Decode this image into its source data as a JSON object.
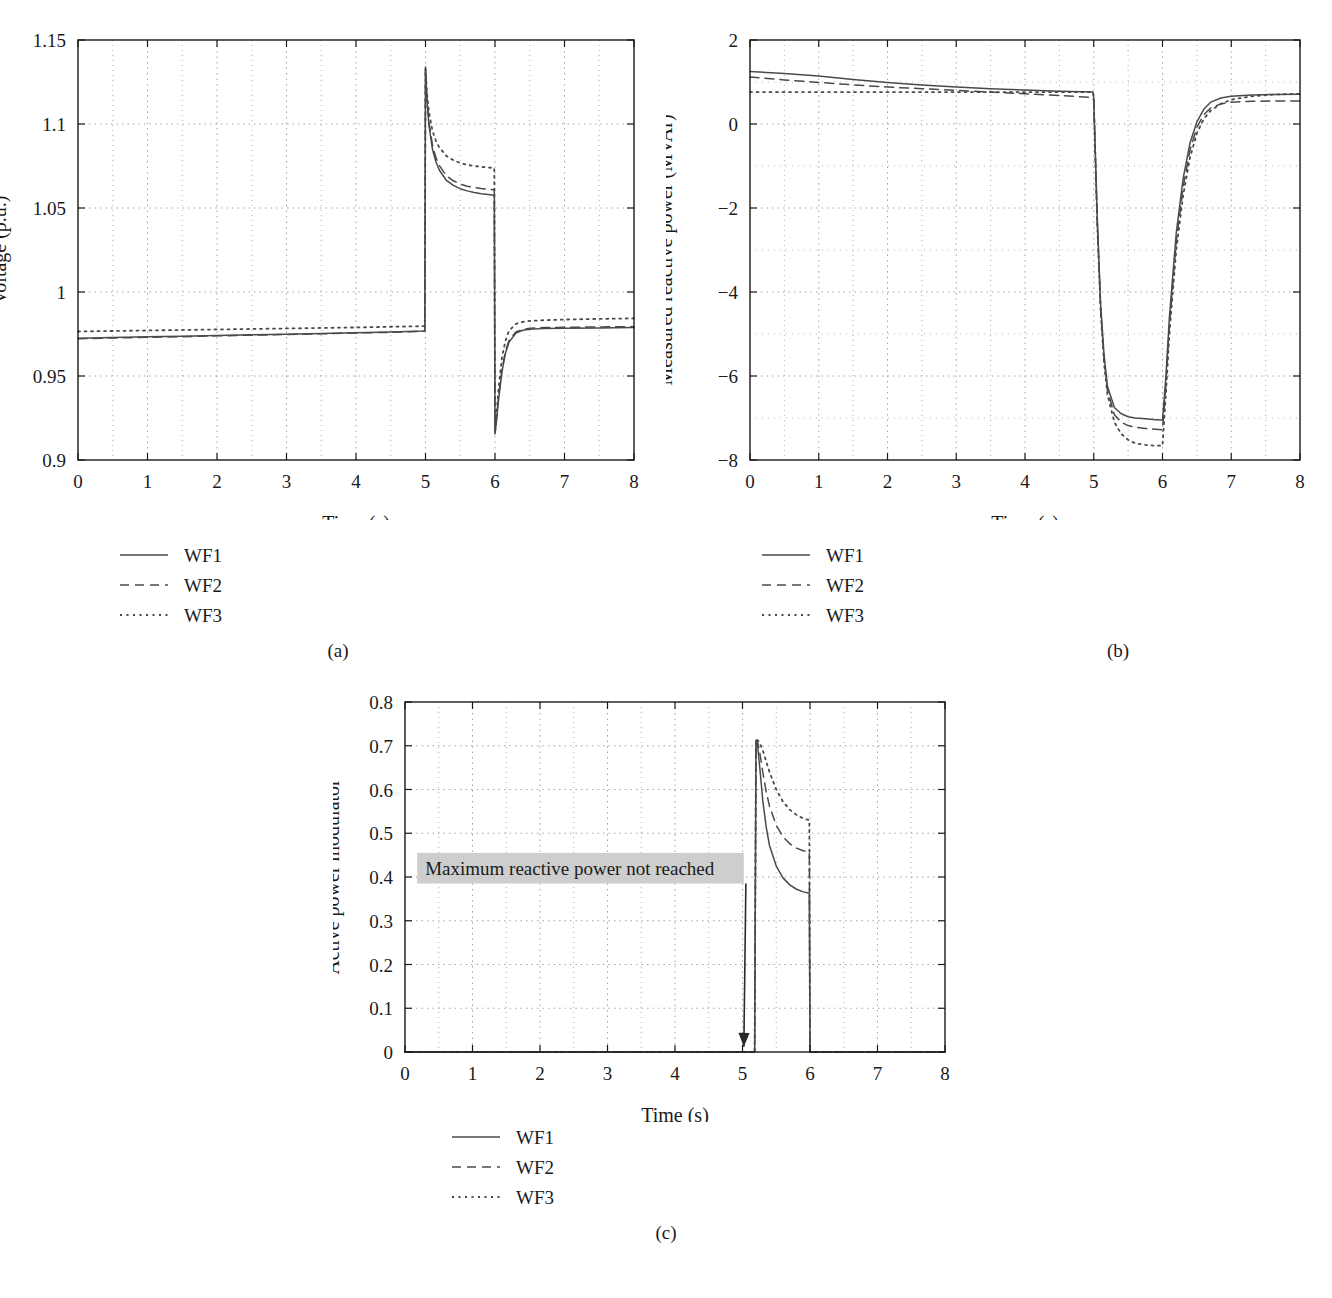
{
  "figure": {
    "panels": [
      {
        "id": "a",
        "caption": "(a)",
        "xlabel": "Time (s)",
        "ylabel": "Voltage (p.u.)"
      },
      {
        "id": "b",
        "caption": "(b)",
        "xlabel": "Time (s)",
        "ylabel": "Measured reactive power (MVAr)"
      },
      {
        "id": "c",
        "caption": "(c)",
        "xlabel": "Time (s)",
        "ylabel": "Active power modulator"
      }
    ],
    "legend": {
      "entries": [
        {
          "label": "WF1",
          "style": "solid"
        },
        {
          "label": "WF2",
          "style": "dashed"
        },
        {
          "label": "WF3",
          "style": "dotted"
        }
      ]
    },
    "annotation": {
      "text": "Maximum reactive power not reached",
      "highlight_color": "#c9c9c9",
      "arrow_from": [
        5.05,
        0.385
      ],
      "arrow_to": [
        5.02,
        0.012
      ]
    },
    "colors": {
      "line": "#4a4a4a",
      "axis": "#1a1a1a",
      "grid": "#9a9a9a",
      "background": "#ffffff"
    }
  },
  "chart_data": [
    {
      "type": "line",
      "panel": "a",
      "title": "",
      "xlabel": "Time (s)",
      "ylabel": "Voltage (p.u.)",
      "xlim": [
        0,
        8
      ],
      "ylim": [
        0.9,
        1.15
      ],
      "xticks": [
        0,
        1,
        2,
        3,
        4,
        5,
        6,
        7,
        8
      ],
      "yticks": [
        0.9,
        0.95,
        1,
        1.05,
        1.1,
        1.15
      ],
      "ytick_labels": [
        "0.9",
        "0.95",
        "1",
        "1.05",
        "1.1",
        "1.15"
      ],
      "grid": true,
      "legend_position": "below-left",
      "series": [
        {
          "name": "WF1",
          "style": "solid",
          "x": [
            0,
            0.5,
            1,
            1.5,
            2,
            2.5,
            3,
            3.5,
            4,
            4.5,
            4.99,
            5.0,
            5.02,
            5.05,
            5.1,
            5.15,
            5.2,
            5.3,
            5.4,
            5.5,
            5.6,
            5.7,
            5.8,
            5.9,
            5.99,
            6.0,
            6.02,
            6.05,
            6.1,
            6.15,
            6.2,
            6.3,
            6.4,
            6.5,
            6.7,
            7.0,
            7.5,
            8.0
          ],
          "y": [
            0.9725,
            0.9729,
            0.9733,
            0.9737,
            0.9741,
            0.9745,
            0.9749,
            0.9753,
            0.9757,
            0.9762,
            0.9768,
            1.134,
            1.115,
            1.099,
            1.085,
            1.0775,
            1.0725,
            1.0665,
            1.0635,
            1.0615,
            1.0602,
            1.0592,
            1.0585,
            1.058,
            1.0576,
            0.9155,
            0.9225,
            0.9355,
            0.9525,
            0.9635,
            0.97,
            0.9755,
            0.9772,
            0.9778,
            0.9782,
            0.9784,
            0.9786,
            0.9788
          ]
        },
        {
          "name": "WF2",
          "style": "dashed",
          "x": [
            0,
            0.5,
            1,
            1.5,
            2,
            2.5,
            3,
            3.5,
            4,
            4.5,
            4.99,
            5.0,
            5.02,
            5.05,
            5.1,
            5.15,
            5.2,
            5.3,
            5.4,
            5.5,
            5.6,
            5.7,
            5.8,
            5.9,
            5.99,
            6.0,
            6.02,
            6.05,
            6.1,
            6.15,
            6.2,
            6.3,
            6.4,
            6.5,
            6.7,
            7.0,
            7.5,
            8.0
          ],
          "y": [
            0.9722,
            0.9726,
            0.973,
            0.9734,
            0.9739,
            0.9743,
            0.9747,
            0.9751,
            0.9756,
            0.976,
            0.9766,
            1.132,
            1.116,
            1.101,
            1.0875,
            1.08,
            1.0752,
            1.0692,
            1.0662,
            1.0642,
            1.063,
            1.0622,
            1.0616,
            1.0612,
            1.0608,
            0.9165,
            0.924,
            0.9372,
            0.954,
            0.9648,
            0.971,
            0.9762,
            0.9778,
            0.9784,
            0.9788,
            0.979,
            0.9792,
            0.9794
          ]
        },
        {
          "name": "WF3",
          "style": "dotted",
          "x": [
            0,
            0.5,
            1,
            1.5,
            2,
            2.5,
            3,
            3.5,
            4,
            4.5,
            4.99,
            5.0,
            5.02,
            5.05,
            5.1,
            5.15,
            5.2,
            5.3,
            5.4,
            5.5,
            5.6,
            5.7,
            5.8,
            5.9,
            5.99,
            6.0,
            6.02,
            6.05,
            6.1,
            6.15,
            6.2,
            6.3,
            6.4,
            6.5,
            6.7,
            7.0,
            7.5,
            8.0
          ],
          "y": [
            0.9765,
            0.9768,
            0.9771,
            0.9774,
            0.9777,
            0.978,
            0.9783,
            0.9786,
            0.9789,
            0.9793,
            0.9797,
            1.133,
            1.119,
            1.107,
            1.096,
            1.09,
            1.086,
            1.081,
            1.0785,
            1.0768,
            1.0757,
            1.075,
            1.0745,
            1.0741,
            1.0738,
            0.916,
            0.926,
            0.942,
            0.961,
            0.971,
            0.9768,
            0.981,
            0.9822,
            0.9828,
            0.9832,
            0.9836,
            0.984,
            0.9843
          ]
        }
      ]
    },
    {
      "type": "line",
      "panel": "b",
      "title": "",
      "xlabel": "Time (s)",
      "ylabel": "Measured reactive power (MVAr)",
      "xlim": [
        0,
        8
      ],
      "ylim": [
        -8,
        2
      ],
      "xticks": [
        0,
        1,
        2,
        3,
        4,
        5,
        6,
        7,
        8
      ],
      "yticks": [
        -8,
        -6,
        -4,
        -2,
        0,
        2
      ],
      "ytick_labels": [
        "−8",
        "−6",
        "−4",
        "−2",
        "0",
        "2"
      ],
      "grid": true,
      "legend_position": "below-left",
      "series": [
        {
          "name": "WF1",
          "style": "solid",
          "x": [
            0,
            0.5,
            1,
            1.5,
            2,
            2.5,
            3,
            3.5,
            4,
            4.5,
            4.99,
            5.0,
            5.05,
            5.1,
            5.15,
            5.2,
            5.3,
            5.4,
            5.5,
            5.6,
            5.75,
            5.9,
            5.99,
            6.0,
            6.05,
            6.1,
            6.2,
            6.3,
            6.4,
            6.5,
            6.6,
            6.7,
            6.85,
            7.0,
            7.3,
            7.6,
            8.0
          ],
          "y": [
            1.25,
            1.2,
            1.14,
            1.06,
            0.99,
            0.93,
            0.88,
            0.84,
            0.81,
            0.78,
            0.76,
            0.62,
            -2.2,
            -4.3,
            -5.5,
            -6.25,
            -6.75,
            -6.9,
            -6.97,
            -7.0,
            -7.02,
            -7.04,
            -7.05,
            -7.05,
            -6.0,
            -4.6,
            -2.6,
            -1.3,
            -0.45,
            0.05,
            0.35,
            0.52,
            0.62,
            0.66,
            0.69,
            0.7,
            0.71
          ]
        },
        {
          "name": "WF2",
          "style": "dashed",
          "x": [
            0,
            0.5,
            1,
            1.5,
            2,
            2.5,
            3,
            3.5,
            4,
            4.5,
            4.99,
            5.0,
            5.05,
            5.1,
            5.15,
            5.2,
            5.3,
            5.4,
            5.5,
            5.6,
            5.75,
            5.9,
            5.99,
            6.0,
            6.05,
            6.1,
            6.2,
            6.3,
            6.4,
            6.5,
            6.6,
            6.7,
            6.85,
            7.0,
            7.3,
            7.6,
            8.0
          ],
          "y": [
            1.12,
            1.05,
            0.99,
            0.93,
            0.88,
            0.84,
            0.8,
            0.76,
            0.72,
            0.68,
            0.63,
            0.55,
            -2.3,
            -4.4,
            -5.6,
            -6.35,
            -6.92,
            -7.1,
            -7.18,
            -7.22,
            -7.25,
            -7.27,
            -7.28,
            -7.28,
            -6.2,
            -4.8,
            -2.8,
            -1.5,
            -0.62,
            -0.08,
            0.22,
            0.38,
            0.48,
            0.52,
            0.54,
            0.55,
            0.55
          ]
        },
        {
          "name": "WF3",
          "style": "dotted",
          "x": [
            0,
            0.5,
            1,
            1.5,
            2,
            2.5,
            3,
            3.5,
            4,
            4.5,
            4.99,
            5.0,
            5.05,
            5.1,
            5.15,
            5.2,
            5.3,
            5.4,
            5.5,
            5.6,
            5.75,
            5.9,
            5.99,
            6.0,
            6.05,
            6.1,
            6.2,
            6.3,
            6.4,
            6.5,
            6.6,
            6.7,
            6.85,
            7.0,
            7.3,
            7.6,
            8.0
          ],
          "y": [
            0.76,
            0.76,
            0.76,
            0.76,
            0.76,
            0.76,
            0.76,
            0.76,
            0.76,
            0.76,
            0.76,
            0.6,
            -2.35,
            -4.45,
            -5.7,
            -6.45,
            -7.1,
            -7.38,
            -7.52,
            -7.6,
            -7.64,
            -7.66,
            -7.66,
            -7.66,
            -6.4,
            -5.0,
            -3.0,
            -1.7,
            -0.8,
            -0.22,
            0.12,
            0.32,
            0.48,
            0.58,
            0.66,
            0.7,
            0.72
          ]
        }
      ]
    },
    {
      "type": "line",
      "panel": "c",
      "title": "",
      "xlabel": "Time (s)",
      "ylabel": "Active power modulator",
      "xlim": [
        0,
        8
      ],
      "ylim": [
        0,
        0.8
      ],
      "xticks": [
        0,
        1,
        2,
        3,
        4,
        5,
        6,
        7,
        8
      ],
      "yticks": [
        0,
        0.1,
        0.2,
        0.3,
        0.4,
        0.5,
        0.6,
        0.7,
        0.8
      ],
      "ytick_labels": [
        "0",
        "0.1",
        "0.2",
        "0.3",
        "0.4",
        "0.5",
        "0.6",
        "0.7",
        "0.8"
      ],
      "grid": true,
      "legend_position": "below-left",
      "series": [
        {
          "name": "WF1",
          "style": "solid",
          "x": [
            0,
            1,
            2,
            3,
            4,
            5,
            5.18,
            5.2,
            5.22,
            5.25,
            5.3,
            5.35,
            5.4,
            5.5,
            5.6,
            5.7,
            5.8,
            5.9,
            5.99,
            6.0,
            6.2,
            7,
            8
          ],
          "y": [
            0,
            0,
            0,
            0,
            0,
            0,
            0,
            0.71,
            0.705,
            0.66,
            0.575,
            0.515,
            0.472,
            0.425,
            0.398,
            0.382,
            0.372,
            0.366,
            0.363,
            0,
            0,
            0,
            0
          ]
        },
        {
          "name": "WF2",
          "style": "dashed",
          "x": [
            0,
            1,
            2,
            3,
            4,
            5,
            5.18,
            5.2,
            5.22,
            5.25,
            5.3,
            5.35,
            5.4,
            5.5,
            5.6,
            5.7,
            5.8,
            5.9,
            5.99,
            6.0,
            6.2,
            7,
            8
          ],
          "y": [
            0,
            0,
            0,
            0,
            0,
            0,
            0,
            0.712,
            0.71,
            0.69,
            0.64,
            0.596,
            0.562,
            0.518,
            0.492,
            0.476,
            0.466,
            0.46,
            0.457,
            0,
            0,
            0,
            0
          ]
        },
        {
          "name": "WF3",
          "style": "dotted",
          "x": [
            0,
            1,
            2,
            3,
            4,
            5,
            5.18,
            5.2,
            5.22,
            5.25,
            5.3,
            5.35,
            5.4,
            5.5,
            5.6,
            5.7,
            5.8,
            5.9,
            5.99,
            6.0,
            6.2,
            7,
            8
          ],
          "y": [
            0,
            0,
            0,
            0,
            0,
            0,
            0,
            0.714,
            0.713,
            0.708,
            0.69,
            0.665,
            0.64,
            0.6,
            0.572,
            0.554,
            0.542,
            0.534,
            0.53,
            0,
            0,
            0,
            0
          ]
        }
      ]
    }
  ]
}
